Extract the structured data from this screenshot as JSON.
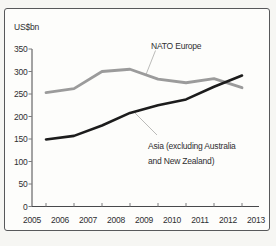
{
  "panel": {
    "background": "#fdfdfb",
    "border_color": "#57585a"
  },
  "chart_data": {
    "type": "line",
    "title": "",
    "ylabel": "US$bn",
    "xlabel": "",
    "x_tick_labels": [
      "2005",
      "2006",
      "2007",
      "2008",
      "2009",
      "2010",
      "2011",
      "2012",
      "2013"
    ],
    "y_tick_labels": [
      "0",
      "50",
      "100",
      "150",
      "200",
      "250",
      "300",
      "350"
    ],
    "y_tick_values": [
      0,
      50,
      100,
      150,
      200,
      250,
      300,
      350
    ],
    "ylim": [
      0,
      350
    ],
    "grid": false,
    "legend_position": "inline-annotations-with-leader-lines",
    "points_note": "data points are plotted at the midpoints between consecutive year labels (2005–2013)",
    "series": [
      {
        "name": "NATO Europe",
        "label_lines": [
          "NATO Europe"
        ],
        "color": "#9b9b9b",
        "values": [
          253,
          262,
          300,
          305,
          283,
          275,
          284,
          264
        ]
      },
      {
        "name": "Asia (excluding Australia and New Zealand)",
        "label_lines": [
          "Asia (excluding Australia",
          "and New Zealand)"
        ],
        "color": "#1c1c1c",
        "values": [
          149,
          157,
          180,
          208,
          225,
          238,
          266,
          291
        ]
      }
    ],
    "colors": {
      "axis": "#48494b",
      "tick": "#7c7c7e",
      "text": "#2f2f31",
      "leader_line": "#b3b3b1"
    }
  }
}
